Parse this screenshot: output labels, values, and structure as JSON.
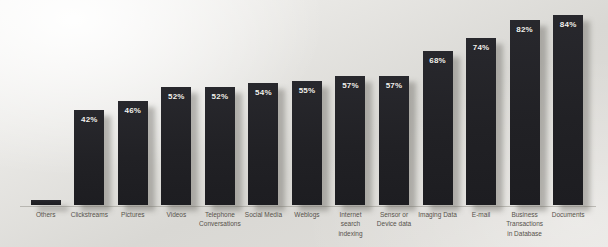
{
  "chart_data": {
    "type": "bar",
    "title": "",
    "xlabel": "",
    "ylabel": "",
    "ylim": [
      0,
      100
    ],
    "grid": false,
    "legend": null,
    "bar_color": "#212125",
    "value_label_color": "#f3f2ee",
    "category_label_color": "#56524b",
    "categories": [
      "Others",
      "Clickstreams",
      "Pictures",
      "Videos",
      "Telephone Conversations",
      "Social Media",
      "Weblogs",
      "Internet search indexing",
      "Sensor or Device data",
      "Imaging Data",
      "E-mail",
      "Business Transactions in Database",
      "Documents"
    ],
    "values": [
      2,
      42,
      46,
      52,
      52,
      54,
      55,
      57,
      57,
      68,
      74,
      82,
      84
    ],
    "value_labels": [
      "",
      "42%",
      "46%",
      "52%",
      "52%",
      "54%",
      "55%",
      "57%",
      "57%",
      "68%",
      "74%",
      "82%",
      "84%"
    ]
  }
}
